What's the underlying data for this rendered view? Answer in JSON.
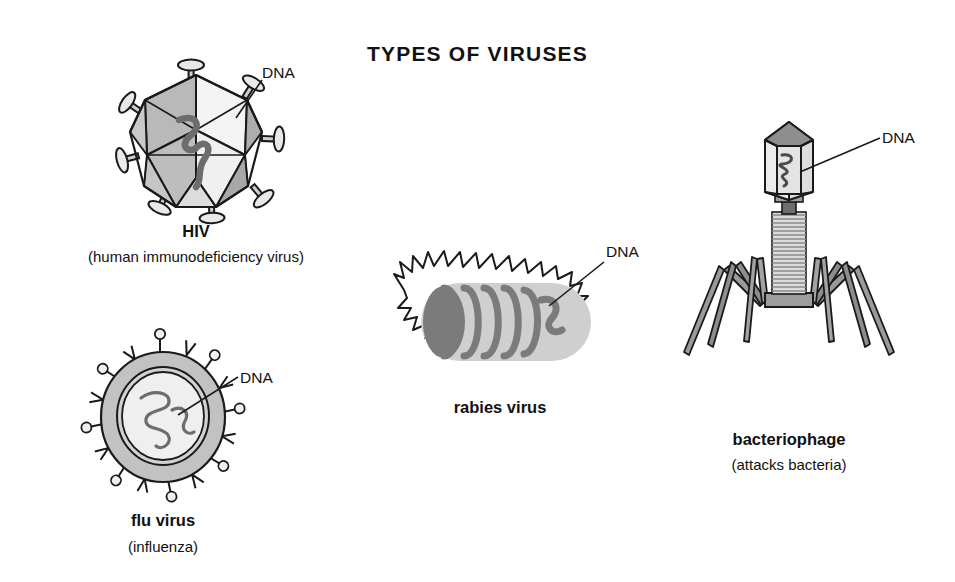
{
  "diagram": {
    "title": "TYPES OF VIRUSES",
    "background_color": "#ffffff",
    "ink_color": "#1a1a1a",
    "fill_light": "#f2f2f2",
    "fill_mid": "#b4b4b4",
    "fill_dark": "#767676"
  },
  "labels": {
    "dna": "DNA"
  },
  "viruses": [
    {
      "id": "hiv",
      "name": "HIV",
      "subtitle": "(human immunodeficiency virus)",
      "shape": "icosahedron-with-spikes",
      "dna_label": "DNA"
    },
    {
      "id": "flu",
      "name": "flu virus",
      "subtitle": "(influenza)",
      "shape": "enveloped-sphere-with-spikes",
      "dna_label": "DNA"
    },
    {
      "id": "rabies",
      "name": "rabies virus",
      "subtitle": "",
      "shape": "bullet-with-spikes",
      "dna_label": "DNA"
    },
    {
      "id": "bacteriophage",
      "name": "bacteriophage",
      "subtitle": "(attacks bacteria)",
      "shape": "head-tail-legs",
      "dna_label": "DNA"
    }
  ]
}
